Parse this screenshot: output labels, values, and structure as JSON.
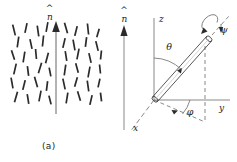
{
  "figure": {
    "background": "#ffffff",
    "ink": "#2b2b2b",
    "width": 237,
    "height": 162,
    "panels": [
      {
        "id": "a",
        "caption": "(a)",
        "director_label": "n",
        "director_hat": "^",
        "description": "nematic rods aligned about director",
        "arrow": {
          "x": 56,
          "y_top": 24,
          "y_bottom": 114
        },
        "rods": [
          {
            "x": 14,
            "y": 30,
            "len": 11,
            "angle": -14
          },
          {
            "x": 26,
            "y": 28,
            "len": 10,
            "angle": 12
          },
          {
            "x": 38,
            "y": 31,
            "len": 11,
            "angle": -8
          },
          {
            "x": 47,
            "y": 27,
            "len": 10,
            "angle": 10
          },
          {
            "x": 66,
            "y": 28,
            "len": 11,
            "angle": -16
          },
          {
            "x": 76,
            "y": 31,
            "len": 10,
            "angle": 14
          },
          {
            "x": 88,
            "y": 29,
            "len": 11,
            "angle": -6
          },
          {
            "x": 98,
            "y": 33,
            "len": 9,
            "angle": 16
          },
          {
            "x": 18,
            "y": 42,
            "len": 11,
            "angle": 8
          },
          {
            "x": 31,
            "y": 44,
            "len": 10,
            "angle": -12
          },
          {
            "x": 43,
            "y": 41,
            "len": 11,
            "angle": 6
          },
          {
            "x": 64,
            "y": 43,
            "len": 10,
            "angle": 13
          },
          {
            "x": 74,
            "y": 45,
            "len": 11,
            "angle": -10
          },
          {
            "x": 86,
            "y": 42,
            "len": 10,
            "angle": 7
          },
          {
            "x": 97,
            "y": 46,
            "len": 10,
            "angle": -14
          },
          {
            "x": 13,
            "y": 55,
            "len": 10,
            "angle": -18
          },
          {
            "x": 24,
            "y": 57,
            "len": 11,
            "angle": 9
          },
          {
            "x": 36,
            "y": 54,
            "len": 10,
            "angle": -5
          },
          {
            "x": 47,
            "y": 58,
            "len": 11,
            "angle": 15
          },
          {
            "x": 66,
            "y": 56,
            "len": 10,
            "angle": -9
          },
          {
            "x": 78,
            "y": 54,
            "len": 11,
            "angle": 11
          },
          {
            "x": 90,
            "y": 58,
            "len": 10,
            "angle": -13
          },
          {
            "x": 101,
            "y": 55,
            "len": 9,
            "angle": 6
          },
          {
            "x": 15,
            "y": 69,
            "len": 11,
            "angle": 13
          },
          {
            "x": 28,
            "y": 71,
            "len": 10,
            "angle": -7
          },
          {
            "x": 40,
            "y": 68,
            "len": 11,
            "angle": 17
          },
          {
            "x": 50,
            "y": 72,
            "len": 9,
            "angle": -11
          },
          {
            "x": 65,
            "y": 70,
            "len": 11,
            "angle": 8
          },
          {
            "x": 77,
            "y": 68,
            "len": 10,
            "angle": -15
          },
          {
            "x": 89,
            "y": 72,
            "len": 11,
            "angle": 10
          },
          {
            "x": 100,
            "y": 69,
            "len": 9,
            "angle": -6
          },
          {
            "x": 12,
            "y": 83,
            "len": 11,
            "angle": -10
          },
          {
            "x": 24,
            "y": 85,
            "len": 10,
            "angle": 14
          },
          {
            "x": 36,
            "y": 82,
            "len": 11,
            "angle": -16
          },
          {
            "x": 47,
            "y": 86,
            "len": 10,
            "angle": 7
          },
          {
            "x": 64,
            "y": 84,
            "len": 11,
            "angle": -12
          },
          {
            "x": 76,
            "y": 82,
            "len": 10,
            "angle": 16
          },
          {
            "x": 88,
            "y": 86,
            "len": 11,
            "angle": -8
          },
          {
            "x": 99,
            "y": 83,
            "len": 9,
            "angle": 12
          },
          {
            "x": 16,
            "y": 97,
            "len": 11,
            "angle": 16
          },
          {
            "x": 28,
            "y": 99,
            "len": 10,
            "angle": -9
          },
          {
            "x": 40,
            "y": 96,
            "len": 11,
            "angle": 11
          },
          {
            "x": 50,
            "y": 100,
            "len": 9,
            "angle": -14
          },
          {
            "x": 67,
            "y": 98,
            "len": 11,
            "angle": 9
          },
          {
            "x": 79,
            "y": 96,
            "len": 10,
            "angle": -17
          },
          {
            "x": 91,
            "y": 100,
            "len": 10,
            "angle": 13
          },
          {
            "x": 101,
            "y": 97,
            "len": 9,
            "angle": -7
          }
        ]
      },
      {
        "id": "b",
        "caption": "(b)",
        "director_label": "n",
        "director_hat": "^",
        "description": "Euler angle geometry of a rod",
        "axes": [
          {
            "name": "z",
            "label": "z"
          },
          {
            "name": "y",
            "label": "y"
          },
          {
            "name": "x",
            "label": "x"
          }
        ],
        "angles": [
          {
            "name": "theta",
            "label": "θ",
            "between": "z-axis and rod"
          },
          {
            "name": "phi",
            "label": "φ",
            "between": "y-axis and projection of rod in x-y plane"
          },
          {
            "name": "psi",
            "label": "ψ",
            "between": "rotation about rod long axis"
          }
        ],
        "director_arrow": {
          "x": 16,
          "y_top": 22,
          "y_bottom": 130
        }
      }
    ]
  }
}
